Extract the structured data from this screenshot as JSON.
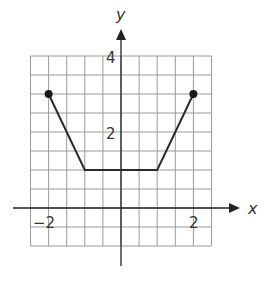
{
  "chart_data": {
    "type": "line",
    "title": "",
    "xlabel": "x",
    "ylabel": "y",
    "xlim": [
      -2.5,
      2.5
    ],
    "ylim": [
      -1,
      4
    ],
    "grid": true,
    "grid_step": 0.5,
    "x_ticks_labeled": [
      -2,
      2
    ],
    "y_ticks_labeled": [
      2,
      4
    ],
    "x_tick_labels": [
      "−2",
      "2"
    ],
    "y_tick_labels": [
      "2",
      "4"
    ],
    "series": [
      {
        "name": "piecewise",
        "points": [
          [
            -2,
            3
          ],
          [
            -1,
            1
          ],
          [
            1,
            1
          ],
          [
            2,
            3
          ]
        ],
        "endpoints": [
          [
            -2,
            3
          ],
          [
            2,
            3
          ]
        ],
        "endpoint_style": "closed"
      }
    ]
  },
  "labels": {
    "x_axis": "x",
    "y_axis": "y",
    "x_neg2": "−2",
    "x_pos2": "2",
    "y_2": "2",
    "y_4": "4"
  }
}
